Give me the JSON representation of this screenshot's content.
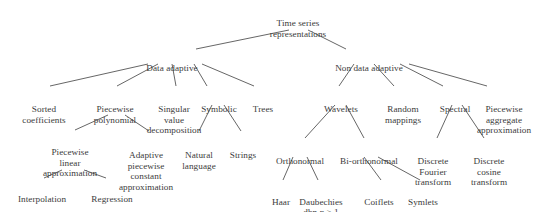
{
  "style": {
    "text_color": "#3b3b3b",
    "line_color": "#4a4a4a",
    "background": "#ffffff"
  },
  "nodes": {
    "root": {
      "label": "Time series\nrepresentations",
      "x": 298,
      "y": 8
    },
    "data_adaptive": {
      "label": "Data adaptive",
      "x": 172,
      "y": 53
    },
    "non_data_adaptive": {
      "label": "Non data adaptive",
      "x": 369,
      "y": 53
    },
    "sorted_coefficients": {
      "label": "Sorted\ncoefficients",
      "x": 44,
      "y": 94
    },
    "piecewise_polynomial": {
      "label": "Piecewise\npolynomial",
      "x": 115,
      "y": 94
    },
    "singular_value_decomposition": {
      "label": "Singular\nvalue\ndecomposition",
      "x": 174,
      "y": 94
    },
    "symbolic": {
      "label": "Symbolic",
      "x": 219,
      "y": 94
    },
    "trees": {
      "label": "Trees",
      "x": 263,
      "y": 94
    },
    "wavelets": {
      "label": "Wavelets",
      "x": 341,
      "y": 94
    },
    "random_mappings": {
      "label": "Random\nmappings",
      "x": 403,
      "y": 94
    },
    "spectral": {
      "label": "Spectral",
      "x": 455,
      "y": 94
    },
    "piecewise_aggregate_approximation": {
      "label": "Piecewise\naggregate\napproximation",
      "x": 504,
      "y": 94
    },
    "piecewise_linear_approximation": {
      "label": "Piecewise\nlinear\napproximation",
      "x": 70,
      "y": 137
    },
    "adaptive_piecewise_constant_approximation": {
      "label": "Adaptive\npiecewise\nconstant\napproximation",
      "x": 146,
      "y": 140
    },
    "natural_language": {
      "label": "Natural\nlanguage",
      "x": 199,
      "y": 140
    },
    "strings": {
      "label": "Strings",
      "x": 243,
      "y": 140
    },
    "orthonormal": {
      "label": "Orthonormal",
      "x": 300,
      "y": 146
    },
    "bi_orthonormal": {
      "label": "Bi-orthonormal",
      "x": 369,
      "y": 146
    },
    "discrete_fourier_transform": {
      "label": "Discrete\nFourier\ntransform",
      "x": 433,
      "y": 146
    },
    "discrete_cosine_transform": {
      "label": "Discrete\ncosine\ntransform",
      "x": 489,
      "y": 146
    },
    "interpolation": {
      "label": "Interpolation",
      "x": 42,
      "y": 184
    },
    "regression": {
      "label": "Regression",
      "x": 112,
      "y": 184
    },
    "haar": {
      "label": "Haar",
      "x": 281,
      "y": 187
    },
    "daubechies": {
      "label": "Daubechies",
      "x": 321,
      "y": 187
    },
    "daubechies_sub_prefix": {
      "label": "dbn ",
      "x": 321,
      "y": 197
    },
    "daubechies_sub_italic": {
      "label": "n"
    },
    "daubechies_sub_suffix": {
      "label": " > 1"
    },
    "coiflets": {
      "label": "Coiflets",
      "x": 379,
      "y": 187
    },
    "symlets": {
      "label": "Symlets",
      "x": 423,
      "y": 187
    }
  },
  "edges": [
    {
      "from": "root",
      "to": "data_adaptive",
      "x1": 289,
      "y1": 30,
      "x2": 196,
      "y2": 49
    },
    {
      "from": "root",
      "to": "non_data_adaptive",
      "x1": 308,
      "y1": 30,
      "x2": 346,
      "y2": 49
    },
    {
      "from": "data_adaptive",
      "to": "sorted_coefficients",
      "x1": 148,
      "y1": 64,
      "x2": 50,
      "y2": 86
    },
    {
      "from": "data_adaptive",
      "to": "piecewise_polynomial",
      "x1": 158,
      "y1": 64,
      "x2": 117,
      "y2": 86
    },
    {
      "from": "data_adaptive",
      "to": "singular_value_decomposition",
      "x1": 172,
      "y1": 64,
      "x2": 176,
      "y2": 86
    },
    {
      "from": "data_adaptive",
      "to": "symbolic",
      "x1": 194,
      "y1": 64,
      "x2": 207,
      "y2": 86
    },
    {
      "from": "data_adaptive",
      "to": "trees",
      "x1": 202,
      "y1": 64,
      "x2": 254,
      "y2": 86
    },
    {
      "from": "non_data_adaptive",
      "to": "wavelets",
      "x1": 354,
      "y1": 64,
      "x2": 339,
      "y2": 86
    },
    {
      "from": "non_data_adaptive",
      "to": "random_mappings",
      "x1": 374,
      "y1": 64,
      "x2": 394,
      "y2": 86
    },
    {
      "from": "non_data_adaptive",
      "to": "spectral",
      "x1": 400,
      "y1": 64,
      "x2": 443,
      "y2": 86
    },
    {
      "from": "non_data_adaptive",
      "to": "piecewise_aggregate_approximation",
      "x1": 409,
      "y1": 64,
      "x2": 487,
      "y2": 86
    },
    {
      "from": "piecewise_polynomial",
      "to": "piecewise_linear_approximation",
      "x1": 108,
      "y1": 115,
      "x2": 75,
      "y2": 130
    },
    {
      "from": "piecewise_polynomial",
      "to": "adaptive_piecewise_constant_approximation",
      "x1": 125,
      "y1": 115,
      "x2": 149,
      "y2": 131
    },
    {
      "from": "symbolic",
      "to": "natural_language",
      "x1": 212,
      "y1": 105,
      "x2": 199,
      "y2": 131
    },
    {
      "from": "symbolic",
      "to": "strings",
      "x1": 224,
      "y1": 105,
      "x2": 241,
      "y2": 131
    },
    {
      "from": "wavelets",
      "to": "orthonormal",
      "x1": 335,
      "y1": 105,
      "x2": 305,
      "y2": 138
    },
    {
      "from": "wavelets",
      "to": "bi_orthonormal",
      "x1": 346,
      "y1": 105,
      "x2": 364,
      "y2": 138
    },
    {
      "from": "spectral",
      "to": "discrete_fourier_transform",
      "x1": 452,
      "y1": 105,
      "x2": 437,
      "y2": 138
    },
    {
      "from": "spectral",
      "to": "discrete_cosine_transform",
      "x1": 462,
      "y1": 105,
      "x2": 484,
      "y2": 138
    },
    {
      "from": "piecewise_linear_approximation",
      "to": "interpolation",
      "x1": 62,
      "y1": 170,
      "x2": 44,
      "y2": 178
    },
    {
      "from": "piecewise_linear_approximation",
      "to": "regression",
      "x1": 84,
      "y1": 170,
      "x2": 106,
      "y2": 178
    },
    {
      "from": "orthonormal",
      "to": "haar",
      "x1": 293,
      "y1": 157,
      "x2": 283,
      "y2": 180
    },
    {
      "from": "orthonormal",
      "to": "daubechies",
      "x1": 307,
      "y1": 157,
      "x2": 318,
      "y2": 180
    },
    {
      "from": "bi_orthonormal",
      "to": "coiflets",
      "x1": 364,
      "y1": 157,
      "x2": 381,
      "y2": 180
    },
    {
      "from": "bi_orthonormal",
      "to": "symlets",
      "x1": 378,
      "y1": 157,
      "x2": 420,
      "y2": 180
    }
  ]
}
